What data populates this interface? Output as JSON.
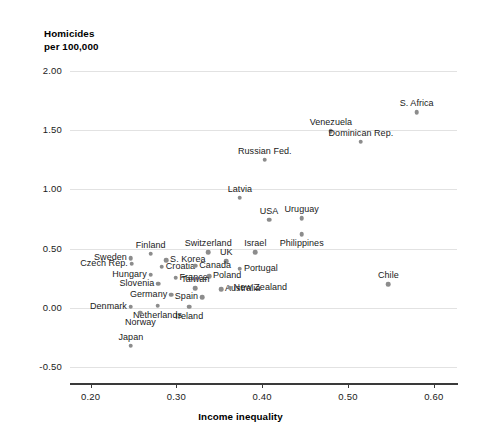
{
  "chart_data": {
    "type": "scatter",
    "title": "",
    "ylabel": "Homicides\nper 100,000",
    "xlabel": "Income inequality",
    "xlim": [
      0.176,
      0.627
    ],
    "ylim": [
      -0.6,
      2.3
    ],
    "xticks": [
      "0.20",
      "0.30",
      "0.40",
      "0.50",
      "0.60"
    ],
    "xtick_values": [
      0.2,
      0.3,
      0.4,
      0.5,
      0.6
    ],
    "yticks": [
      "2.00",
      "1.50",
      "1.00",
      "0.50",
      "0.00",
      "-0.50"
    ],
    "ytick_values": [
      2.0,
      1.5,
      1.0,
      0.5,
      0.0,
      -0.5
    ],
    "grid": "horizontal",
    "legend": "none",
    "point_color": "#8c8c8c",
    "points": [
      {
        "label": "S. Africa",
        "x": 0.58,
        "y": 1.65,
        "lx": "center",
        "ly": "above"
      },
      {
        "label": "Venezuela",
        "x": 0.48,
        "y": 1.49,
        "lx": "center",
        "ly": "above"
      },
      {
        "label": "Dominican Rep.",
        "x": 0.515,
        "y": 1.4,
        "lx": "center",
        "ly": "above"
      },
      {
        "label": "Russian Fed.",
        "x": 0.403,
        "y": 1.25,
        "lx": "center",
        "ly": "above"
      },
      {
        "label": "Latvia",
        "x": 0.374,
        "y": 0.93,
        "lx": "center",
        "ly": "above"
      },
      {
        "label": "USA",
        "x": 0.408,
        "y": 0.745,
        "lx": "center",
        "ly": "above"
      },
      {
        "label": "Uruguay",
        "x": 0.446,
        "y": 0.755,
        "lx": "center",
        "ly": "above"
      },
      {
        "label": "Philippines",
        "x": 0.446,
        "y": 0.62,
        "lx": "center",
        "ly": "below"
      },
      {
        "label": "Chile",
        "x": 0.547,
        "y": 0.2,
        "lx": "center",
        "ly": "above"
      },
      {
        "label": "Israel",
        "x": 0.392,
        "y": 0.47,
        "lx": "center",
        "ly": "above"
      },
      {
        "label": "Switzerland",
        "x": 0.337,
        "y": 0.47,
        "lx": "center",
        "ly": "above"
      },
      {
        "label": "Finland",
        "x": 0.27,
        "y": 0.455,
        "lx": "center",
        "ly": "above"
      },
      {
        "label": "Sweden",
        "x": 0.247,
        "y": 0.42,
        "lx": "right",
        "ly": "mid"
      },
      {
        "label": "S. Korea",
        "x": 0.288,
        "y": 0.4,
        "lx": "left",
        "ly": "mid"
      },
      {
        "label": "UK",
        "x": 0.358,
        "y": 0.395,
        "lx": "center",
        "ly": "above"
      },
      {
        "label": "Portugal",
        "x": 0.374,
        "y": 0.33,
        "lx": "left",
        "ly": "mid"
      },
      {
        "label": "Czech Rep.",
        "x": 0.248,
        "y": 0.37,
        "lx": "right",
        "ly": "mid"
      },
      {
        "label": "Croatia",
        "x": 0.283,
        "y": 0.345,
        "lx": "left",
        "ly": "mid"
      },
      {
        "label": "Canada",
        "x": 0.322,
        "y": 0.355,
        "lx": "left",
        "ly": "mid"
      },
      {
        "label": "Hungary",
        "x": 0.27,
        "y": 0.28,
        "lx": "right",
        "ly": "mid"
      },
      {
        "label": "France",
        "x": 0.299,
        "y": 0.255,
        "lx": "left",
        "ly": "mid"
      },
      {
        "label": "Poland",
        "x": 0.338,
        "y": 0.265,
        "lx": "left",
        "ly": "mid"
      },
      {
        "label": "Slovenia",
        "x": 0.279,
        "y": 0.205,
        "lx": "right",
        "ly": "mid"
      },
      {
        "label": "Taiwan",
        "x": 0.322,
        "y": 0.165,
        "lx": "center",
        "ly": "above"
      },
      {
        "label": "Germany",
        "x": 0.294,
        "y": 0.11,
        "lx": "right",
        "ly": "mid"
      },
      {
        "label": "Spain",
        "x": 0.33,
        "y": 0.09,
        "lx": "right",
        "ly": "mid"
      },
      {
        "label": "Australia",
        "x": 0.352,
        "y": 0.155,
        "lx": "left",
        "ly": "mid"
      },
      {
        "label": "New Zealand",
        "x": 0.362,
        "y": 0.17,
        "lx": "left",
        "ly": "mid"
      },
      {
        "label": "Denmark",
        "x": 0.247,
        "y": 0.01,
        "lx": "right",
        "ly": "mid"
      },
      {
        "label": "Netherlands",
        "x": 0.278,
        "y": 0.02,
        "lx": "center",
        "ly": "below"
      },
      {
        "label": "Norway",
        "x": 0.258,
        "y": -0.04,
        "lx": "center",
        "ly": "below"
      },
      {
        "label": "Ireland",
        "x": 0.315,
        "y": 0.01,
        "lx": "center",
        "ly": "below"
      },
      {
        "label": "Japan",
        "x": 0.247,
        "y": -0.32,
        "lx": "center",
        "ly": "above"
      }
    ]
  }
}
